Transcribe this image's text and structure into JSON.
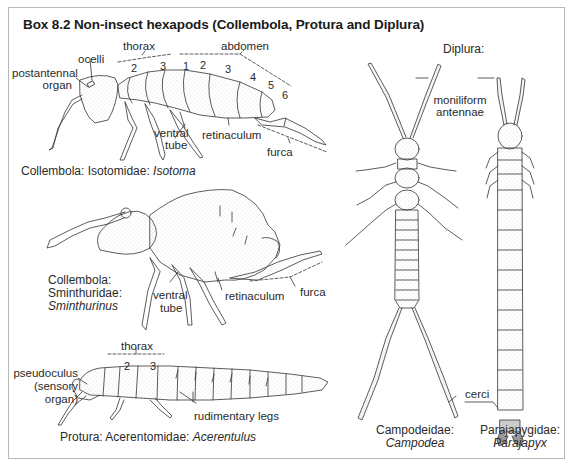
{
  "title": "Box 8.2  Non-insect hexapods (Collembola, Protura and Diplura)",
  "isotoma": {
    "labels": {
      "thorax": "thorax",
      "abdomen": "abdomen",
      "ocelli": "ocelli",
      "postantennal_organ_1": "postantennal",
      "postantennal_organ_2": "organ",
      "ventral_tube_1": "ventral",
      "ventral_tube_2": "tube",
      "retinaculum": "retinaculum",
      "furca": "furca"
    },
    "segments": [
      "2",
      "3",
      "1",
      "2",
      "3",
      "4",
      "5",
      "6"
    ],
    "caption_prefix": "Collembola: Isotomidae: ",
    "caption_genus": "Isotoma"
  },
  "sminthurinus": {
    "labels": {
      "ventral_tube_1": "ventral",
      "ventral_tube_2": "tube",
      "retinaculum": "retinaculum",
      "furca": "furca"
    },
    "caption_line1": "Collembola:",
    "caption_line2": "Sminthuridae:",
    "caption_genus": "Sminthurinus"
  },
  "acerentulus": {
    "labels": {
      "thorax": "thorax",
      "pseudoculus_1": "pseudoculus",
      "pseudoculus_2": "(sensory",
      "pseudoculus_3": "organ)",
      "rudimentary_legs": "rudimentary legs"
    },
    "segments": [
      "2",
      "3"
    ],
    "caption_prefix": "Protura: Acerentomidae: ",
    "caption_genus": "Acerentulus"
  },
  "diplura": {
    "heading": "Diplura:",
    "labels": {
      "moniliform_1": "moniliform",
      "moniliform_2": "antennae",
      "cerci": "cerci"
    },
    "campodea": {
      "family": "Campodeidae:",
      "genus": "Campodea"
    },
    "parajapyx": {
      "family": "Parajapygidae:",
      "genus": "Parajapyx"
    }
  }
}
